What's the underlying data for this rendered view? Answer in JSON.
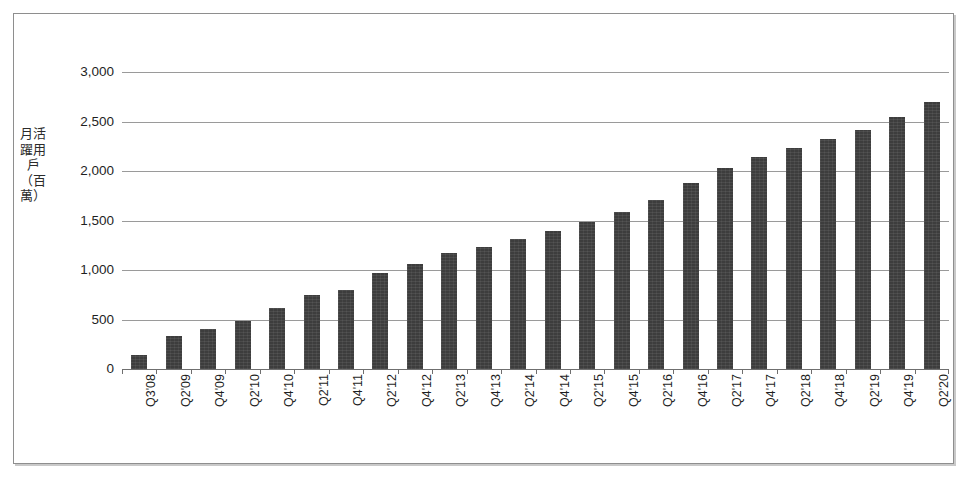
{
  "chart_data": {
    "type": "bar",
    "title": "",
    "subtitle": "",
    "xlabel": "",
    "ylabel": "月活躍用戶（百萬）",
    "ylim": [
      0,
      3000
    ],
    "ytick_values": [
      0,
      500,
      1000,
      1500,
      2000,
      2500,
      3000
    ],
    "ytick_labels": [
      "0",
      "500",
      "1,000",
      "1,500",
      "2,000",
      "2,500",
      "3,000"
    ],
    "grid": "horizontal",
    "legend": "none",
    "bar_color": "#3d3d3d",
    "categories": [
      "Q3'08",
      "Q2'09",
      "Q4'09",
      "Q2'10",
      "Q4'10",
      "Q2'11",
      "Q4'11",
      "Q2'12",
      "Q4'12",
      "Q2'13",
      "Q4'13",
      "Q2'14",
      "Q4'14",
      "Q2'15",
      "Q4'15",
      "Q2'16",
      "Q4'16",
      "Q2'17",
      "Q4'17",
      "Q2'18",
      "Q4'18",
      "Q2'19",
      "Q4'19",
      "Q2'20"
    ],
    "values": [
      145,
      330,
      400,
      480,
      620,
      750,
      800,
      970,
      1060,
      1170,
      1230,
      1310,
      1390,
      1490,
      1590,
      1710,
      1880,
      2030,
      2140,
      2230,
      2320,
      2410,
      2550,
      2700
    ]
  },
  "figure": {
    "border_color": "#8e8e8e",
    "background": "#ffffff"
  }
}
